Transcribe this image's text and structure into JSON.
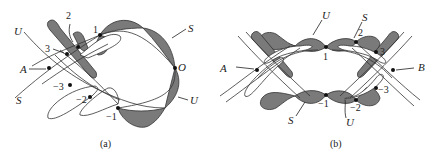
{
  "figure": {
    "panel_a": {
      "caption": "(a)",
      "labels": {
        "U_top": "U",
        "S_bottom": "S",
        "A": "A",
        "S_right": "S",
        "O": "O",
        "U_right": "U"
      },
      "points": [
        "1",
        "2",
        "3",
        "−3",
        "−2",
        "−1"
      ]
    },
    "panel_b": {
      "caption": "(b)",
      "labels": {
        "U_top": "U",
        "S_top": "S",
        "A": "A",
        "B": "B",
        "S_bottom": "S",
        "U_bottom": "U"
      },
      "points": [
        "1",
        "2",
        "3",
        "−1",
        "−2",
        "−3"
      ]
    },
    "colors": {
      "lobe_fill": "#7a7a7a",
      "stroke": "#333333",
      "background": "#ffffff"
    }
  }
}
